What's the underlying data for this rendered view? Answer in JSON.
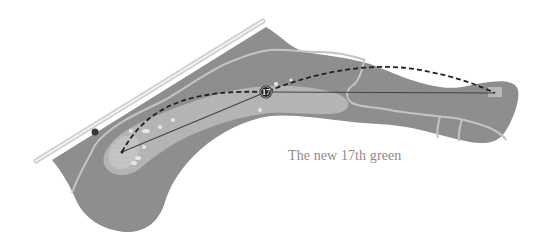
{
  "caption": "The new 17th green",
  "hole_marker": {
    "number": "17"
  },
  "colors": {
    "background": "#ffffff",
    "rough": "#8e8e8e",
    "fairway": "#b4b4b4",
    "paths": "#c8c8c8",
    "boundary": "#d6d6d6",
    "shot_line": "#444444",
    "marker": "#1e1e1e",
    "caption": "#8c8c8c"
  }
}
